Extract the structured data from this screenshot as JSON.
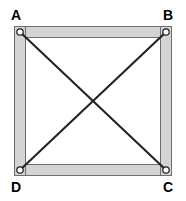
{
  "figure": {
    "background_color": "#ffffff",
    "width": 186,
    "height": 201,
    "frame": {
      "description": "Four light-gray rectangular members forming a closed square frame",
      "fill_color": "#d4d4d4",
      "stroke_color": "#6e6e6e",
      "stroke_width": 1,
      "outer": {
        "x": 14,
        "y": 26,
        "width": 158,
        "height": 150
      },
      "inner": {
        "x": 26,
        "y": 38,
        "width": 134,
        "height": 126
      },
      "member_thickness": 12
    },
    "joints": {
      "description": "Pinned connections drawn as small open circles at each corner",
      "radius": 3.2,
      "fill_color": "#ffffff",
      "stroke_color": "#1a1a1a",
      "stroke_width": 1.2,
      "points": [
        {
          "id": "A",
          "x": 20,
          "y": 32
        },
        {
          "id": "B",
          "x": 166,
          "y": 32
        },
        {
          "id": "C",
          "x": 166,
          "y": 170
        },
        {
          "id": "D",
          "x": 20,
          "y": 170
        }
      ]
    },
    "diagonals": {
      "description": "Two straight black brace lines connecting opposite corner joints",
      "stroke_color": "#222222",
      "stroke_width": 2.1,
      "members": [
        {
          "id": "AC",
          "from": "A",
          "to": "C",
          "x1": 20,
          "y1": 32,
          "x2": 166,
          "y2": 170
        },
        {
          "id": "BD",
          "from": "B",
          "to": "D",
          "x1": 166,
          "y1": 32,
          "x2": 20,
          "y2": 170
        }
      ],
      "intersection": {
        "x": 93,
        "y": 101
      }
    },
    "labels": [
      {
        "id": "A",
        "text": "A",
        "corner": "top-left",
        "x": 11,
        "y": 8
      },
      {
        "id": "B",
        "text": "B",
        "corner": "top-right",
        "x": 163,
        "y": 8
      },
      {
        "id": "C",
        "text": "C",
        "corner": "bottom-right",
        "x": 163,
        "y": 180
      },
      {
        "id": "D",
        "text": "D",
        "corner": "bottom-left",
        "x": 11,
        "y": 180
      }
    ]
  }
}
